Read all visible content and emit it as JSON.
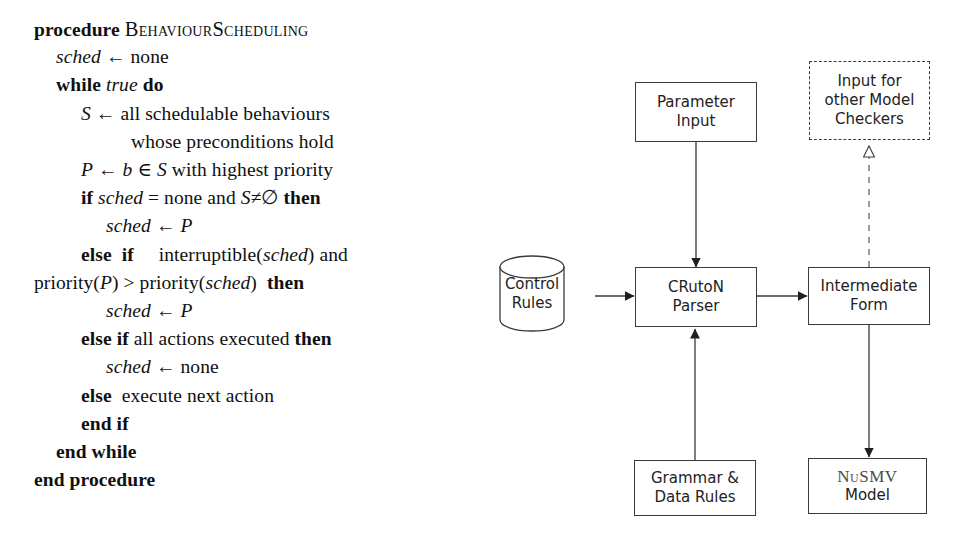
{
  "algorithm": {
    "lines": [
      {
        "indent": 0,
        "segments": [
          {
            "t": "procedure ",
            "s": "kw"
          },
          {
            "t": "BehaviourScheduling",
            "s": "sc"
          }
        ]
      },
      {
        "indent": 22,
        "segments": [
          {
            "t": "sched",
            "s": "var"
          },
          {
            "t": " ← none",
            "s": ""
          }
        ]
      },
      {
        "indent": 22,
        "segments": [
          {
            "t": "while ",
            "s": "kw"
          },
          {
            "t": "true",
            "s": "var"
          },
          {
            "t": " ",
            "s": ""
          },
          {
            "t": "do",
            "s": "kw"
          }
        ]
      },
      {
        "indent": 47,
        "segments": [
          {
            "t": "S",
            "s": "var"
          },
          {
            "t": " ← all schedulable behaviours",
            "s": ""
          }
        ]
      },
      {
        "indent": 97,
        "segments": [
          {
            "t": "whose preconditions hold",
            "s": ""
          }
        ]
      },
      {
        "indent": 47,
        "segments": [
          {
            "t": "P",
            "s": "var"
          },
          {
            "t": " ← ",
            "s": ""
          },
          {
            "t": "b",
            "s": "var"
          },
          {
            "t": " ∈ ",
            "s": ""
          },
          {
            "t": "S",
            "s": "var"
          },
          {
            "t": " with highest priority",
            "s": ""
          }
        ]
      },
      {
        "indent": 47,
        "segments": [
          {
            "t": "if ",
            "s": "kw"
          },
          {
            "t": "sched",
            "s": "var"
          },
          {
            "t": " = none and ",
            "s": ""
          },
          {
            "t": "S",
            "s": "var"
          },
          {
            "t": "≠∅ ",
            "s": ""
          },
          {
            "t": "then",
            "s": "kw"
          }
        ]
      },
      {
        "indent": 72,
        "segments": [
          {
            "t": "sched",
            "s": "var"
          },
          {
            "t": " ← ",
            "s": ""
          },
          {
            "t": "P",
            "s": "var"
          }
        ]
      },
      {
        "indent": 47,
        "segments": [
          {
            "t": "else",
            "s": "kw"
          },
          {
            "t": "  ",
            "s": ""
          },
          {
            "t": "if",
            "s": "kw"
          },
          {
            "t": "     interruptible(",
            "s": ""
          },
          {
            "t": "sched",
            "s": "var"
          },
          {
            "t": ") and",
            "s": ""
          }
        ]
      },
      {
        "indent": 0,
        "segments": [
          {
            "t": "priority(",
            "s": ""
          },
          {
            "t": "P",
            "s": "var"
          },
          {
            "t": ") > priority(",
            "s": ""
          },
          {
            "t": "sched",
            "s": "var"
          },
          {
            "t": ")  ",
            "s": ""
          },
          {
            "t": "then",
            "s": "kw"
          }
        ]
      },
      {
        "indent": 72,
        "segments": [
          {
            "t": "sched",
            "s": "var"
          },
          {
            "t": " ← ",
            "s": ""
          },
          {
            "t": "P",
            "s": "var"
          }
        ]
      },
      {
        "indent": 47,
        "segments": [
          {
            "t": "else if ",
            "s": "kw"
          },
          {
            "t": "all actions executed ",
            "s": ""
          },
          {
            "t": "then",
            "s": "kw"
          }
        ]
      },
      {
        "indent": 72,
        "segments": [
          {
            "t": "sched",
            "s": "var"
          },
          {
            "t": " ← none",
            "s": ""
          }
        ]
      },
      {
        "indent": 47,
        "segments": [
          {
            "t": "else",
            "s": "kw"
          },
          {
            "t": "  execute next action",
            "s": ""
          }
        ]
      },
      {
        "indent": 47,
        "segments": [
          {
            "t": "end if",
            "s": "kw"
          }
        ]
      },
      {
        "indent": 22,
        "segments": [
          {
            "t": "end while",
            "s": "kw"
          }
        ]
      },
      {
        "indent": 0,
        "segments": [
          {
            "t": "end procedure",
            "s": "kw"
          }
        ]
      }
    ],
    "plain_text": [
      "procedure BehaviourScheduling",
      "sched ← none",
      "while true do",
      "S ← all schedulable behaviours",
      "whose preconditions hold",
      "P ← b ∈ S with highest priority",
      "if sched = none and S≠∅ then",
      "sched ← P",
      "else if interruptible(sched) and",
      "priority(P) > priority(sched) then",
      "sched ← P",
      "else if all actions executed then",
      "sched ← none",
      "else execute next action",
      "end if",
      "end while",
      "end procedure"
    ]
  },
  "diagram": {
    "nodes": {
      "parameter_input": {
        "label_line1": "Parameter",
        "label_line2": "Input",
        "shape": "rect",
        "style": "solid"
      },
      "input_other_checkers": {
        "label_line1": "Input for",
        "label_line2": "other Model",
        "label_line3": "Checkers",
        "shape": "rect",
        "style": "dashed"
      },
      "control_rules": {
        "label_line1": "Control",
        "label_line2": "Rules",
        "shape": "cylinder",
        "style": "solid"
      },
      "cruton_parser": {
        "label_line1": "CRutoN",
        "label_line2": "Parser",
        "shape": "rect",
        "style": "solid"
      },
      "intermediate_form": {
        "label_line1": "Intermediate",
        "label_line2": "Form",
        "shape": "rect",
        "style": "solid"
      },
      "grammar_data_rules": {
        "label_line1": "Grammar &",
        "label_line2": "Data Rules",
        "shape": "rect",
        "style": "solid"
      },
      "nusmv_model": {
        "label_line1": "NuSMV",
        "label_line2": "Model",
        "shape": "rect",
        "style": "solid"
      }
    },
    "edges": [
      {
        "name": "parameter-input-to-parser",
        "from": "parameter_input",
        "to": "cruton_parser",
        "style": "solid",
        "arrowhead": "filled"
      },
      {
        "name": "control-rules-to-parser",
        "from": "control_rules",
        "to": "cruton_parser",
        "style": "solid",
        "arrowhead": "filled"
      },
      {
        "name": "grammar-to-parser",
        "from": "grammar_data_rules",
        "to": "cruton_parser",
        "style": "solid",
        "arrowhead": "filled"
      },
      {
        "name": "parser-to-intermediate-form",
        "from": "cruton_parser",
        "to": "intermediate_form",
        "style": "solid",
        "arrowhead": "filled"
      },
      {
        "name": "intermediate-form-to-nusmv",
        "from": "intermediate_form",
        "to": "nusmv_model",
        "style": "solid",
        "arrowhead": "filled"
      },
      {
        "name": "intermediate-form-to-other-checkers",
        "from": "intermediate_form",
        "to": "input_other_checkers",
        "style": "dashed",
        "arrowhead": "hollow"
      }
    ]
  },
  "colors": {
    "stroke": "#3a3a3a",
    "text": "#222222",
    "background": "#ffffff"
  }
}
